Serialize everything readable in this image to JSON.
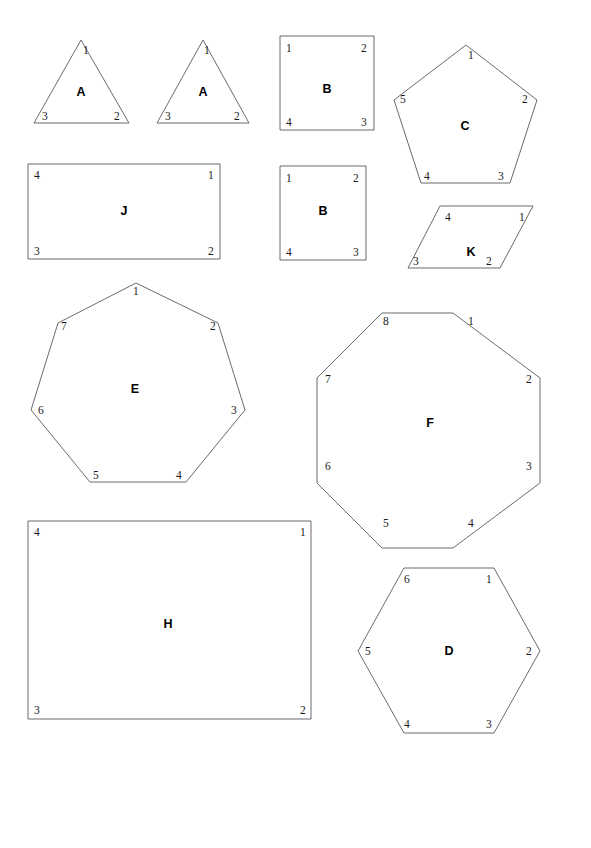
{
  "page": {
    "header_note": "",
    "background_color": "#ffffff",
    "stroke_color": "#5a5a5f",
    "label_color": "#000000",
    "width": 591,
    "height": 848
  },
  "figure": {
    "shapes": [
      {
        "id": "triangle-a-left",
        "letter": "A",
        "kind": "triangle",
        "sides": 3,
        "letter_pos": [
          81,
          96
        ],
        "points": "81,40 129,123 34,123",
        "vertices": [
          {
            "label": "1",
            "x": 83,
            "y": 54
          },
          {
            "label": "2",
            "x": 114,
            "y": 120
          },
          {
            "label": "3",
            "x": 42,
            "y": 120
          }
        ]
      },
      {
        "id": "triangle-a-right",
        "letter": "A",
        "kind": "triangle",
        "sides": 3,
        "letter_pos": [
          203,
          96
        ],
        "points": "203,40 249,123 157,123",
        "vertices": [
          {
            "label": "1",
            "x": 204,
            "y": 54
          },
          {
            "label": "2",
            "x": 234,
            "y": 120
          },
          {
            "label": "3",
            "x": 165,
            "y": 120
          }
        ]
      },
      {
        "id": "square-b-top",
        "letter": "B",
        "kind": "square",
        "sides": 4,
        "letter_pos": [
          327,
          93
        ],
        "points": "280,36 374,36 374,130 280,130",
        "vertices": [
          {
            "label": "1",
            "x": 286,
            "y": 52
          },
          {
            "label": "2",
            "x": 361,
            "y": 52
          },
          {
            "label": "4",
            "x": 286,
            "y": 126
          },
          {
            "label": "3",
            "x": 361,
            "y": 126
          }
        ]
      },
      {
        "id": "square-b-bottom",
        "letter": "B",
        "kind": "square",
        "sides": 4,
        "letter_pos": [
          323,
          215
        ],
        "points": "280,166 366,166 366,260 280,260",
        "vertices": [
          {
            "label": "1",
            "x": 286,
            "y": 182
          },
          {
            "label": "2",
            "x": 353,
            "y": 182
          },
          {
            "label": "4",
            "x": 286,
            "y": 256
          },
          {
            "label": "3",
            "x": 353,
            "y": 256
          }
        ]
      },
      {
        "id": "pentagon-c",
        "letter": "C",
        "kind": "pentagon",
        "sides": 5,
        "letter_pos": [
          465,
          130
        ],
        "points": "466,45 537,100 510,183 421,183 394,100",
        "vertices": [
          {
            "label": "1",
            "x": 468,
            "y": 59
          },
          {
            "label": "2",
            "x": 522,
            "y": 103
          },
          {
            "label": "3",
            "x": 498,
            "y": 180
          },
          {
            "label": "4",
            "x": 424,
            "y": 180
          },
          {
            "label": "5",
            "x": 400,
            "y": 103
          }
        ]
      },
      {
        "id": "rectangle-j",
        "letter": "J",
        "kind": "rectangle",
        "sides": 4,
        "letter_pos": [
          124,
          215
        ],
        "points": "28,164 220,164 220,259 28,259",
        "vertices": [
          {
            "label": "4",
            "x": 34,
            "y": 179
          },
          {
            "label": "1",
            "x": 208,
            "y": 179
          },
          {
            "label": "3",
            "x": 34,
            "y": 255
          },
          {
            "label": "2",
            "x": 208,
            "y": 255
          }
        ]
      },
      {
        "id": "parallelogram-k",
        "letter": "K",
        "kind": "parallelogram",
        "sides": 4,
        "letter_pos": [
          471,
          256
        ],
        "points": "440,206 533,206 500,268 408,268",
        "vertices": [
          {
            "label": "4",
            "x": 445,
            "y": 221
          },
          {
            "label": "1",
            "x": 519,
            "y": 221
          },
          {
            "label": "2",
            "x": 486,
            "y": 265
          },
          {
            "label": "3",
            "x": 413,
            "y": 265
          }
        ]
      },
      {
        "id": "heptagon-e",
        "letter": "E",
        "kind": "heptagon",
        "sides": 7,
        "letter_pos": [
          135,
          393
        ],
        "points": "136,283 218,323 245,410 186,482 90,482 31,410 58,323",
        "vertices": [
          {
            "label": "1",
            "x": 133,
            "y": 295
          },
          {
            "label": "2",
            "x": 210,
            "y": 330
          },
          {
            "label": "3",
            "x": 231,
            "y": 414
          },
          {
            "label": "4",
            "x": 176,
            "y": 479
          },
          {
            "label": "5",
            "x": 93,
            "y": 479
          },
          {
            "label": "6",
            "x": 38,
            "y": 414
          },
          {
            "label": "7",
            "x": 61,
            "y": 330
          }
        ]
      },
      {
        "id": "octagon-f",
        "letter": "F",
        "kind": "octagon",
        "sides": 8,
        "letter_pos": [
          430,
          427
        ],
        "points": "453,313 540,378 540,483 453,548 382,548 317,483 317,378 382,313",
        "vertices": [
          {
            "label": "1",
            "x": 468,
            "y": 325
          },
          {
            "label": "2",
            "x": 526,
            "y": 383
          },
          {
            "label": "3",
            "x": 526,
            "y": 470
          },
          {
            "label": "4",
            "x": 468,
            "y": 527
          },
          {
            "label": "5",
            "x": 383,
            "y": 527
          },
          {
            "label": "6",
            "x": 325,
            "y": 470
          },
          {
            "label": "7",
            "x": 325,
            "y": 383
          },
          {
            "label": "8",
            "x": 383,
            "y": 325
          }
        ]
      },
      {
        "id": "rectangle-h",
        "letter": "H",
        "kind": "rectangle",
        "sides": 4,
        "letter_pos": [
          168,
          628
        ],
        "points": "28,521 311,521 311,719 28,719",
        "vertices": [
          {
            "label": "4",
            "x": 34,
            "y": 536
          },
          {
            "label": "1",
            "x": 300,
            "y": 536
          },
          {
            "label": "3",
            "x": 34,
            "y": 714
          },
          {
            "label": "2",
            "x": 300,
            "y": 714
          }
        ]
      },
      {
        "id": "hexagon-d",
        "letter": "D",
        "kind": "hexagon",
        "sides": 6,
        "letter_pos": [
          449,
          655
        ],
        "points": "494,568 540,651 494,733 404,733 358,651 404,568",
        "vertices": [
          {
            "label": "1",
            "x": 486,
            "y": 583
          },
          {
            "label": "2",
            "x": 526,
            "y": 655
          },
          {
            "label": "3",
            "x": 486,
            "y": 728
          },
          {
            "label": "4",
            "x": 404,
            "y": 728
          },
          {
            "label": "5",
            "x": 365,
            "y": 655
          },
          {
            "label": "6",
            "x": 404,
            "y": 583
          }
        ]
      }
    ]
  }
}
